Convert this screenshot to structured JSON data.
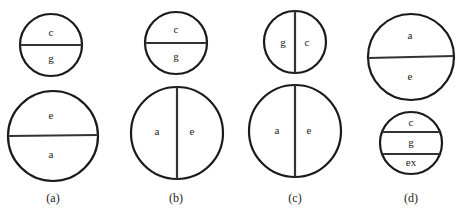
{
  "figure": {
    "panels": [
      {
        "caption": "(a)",
        "top": {
          "regions": [
            "c",
            "g"
          ],
          "split": "horizontal"
        },
        "bottom": {
          "regions": [
            "e",
            "a"
          ],
          "split": "horizontal"
        }
      },
      {
        "caption": "(b)",
        "top": {
          "regions": [
            "c",
            "g"
          ],
          "split": "horizontal"
        },
        "bottom": {
          "regions": [
            "a",
            "e"
          ],
          "split": "vertical"
        }
      },
      {
        "caption": "(c)",
        "top": {
          "regions": [
            "g",
            "c"
          ],
          "split": "vertical"
        },
        "bottom": {
          "regions": [
            "a",
            "e"
          ],
          "split": "vertical"
        }
      },
      {
        "caption": "(d)",
        "top": {
          "regions": [
            "a",
            "e"
          ],
          "split": "horizontal"
        },
        "bottom": {
          "regions": [
            "c",
            "g",
            "ex"
          ],
          "split": "horizontal"
        }
      }
    ]
  }
}
